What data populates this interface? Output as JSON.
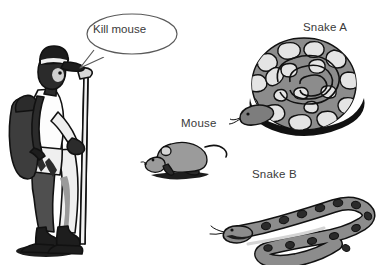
{
  "image": {
    "kind": "illustration",
    "background_color": "#ffffff",
    "width": 386,
    "height": 265
  },
  "speech": {
    "text": "Kill mouse",
    "speaker": "hiker",
    "bubble_shape": "ellipse-with-tail",
    "tail_direction": "down-left",
    "stroke_color": "#4a4a4a",
    "fill_color": "#ffffff"
  },
  "labels": {
    "snake_a": "Snake A",
    "snake_b": "Snake B",
    "mouse": "Mouse",
    "text_color": "#3a3a3a"
  },
  "figures": [
    {
      "name": "hiker",
      "description": "Man standing in profile facing right, wearing a cap, backpack, shorts and boots, holding a trekking pole",
      "palette": {
        "dark": "#1d1d1d",
        "mid": "#5f5f5f",
        "light": "#d8d8d8",
        "white": "#fdfdfd",
        "outline": "#111111"
      }
    },
    {
      "name": "mouse",
      "description": "Grey rat facing left with long tail and dark shadow beneath",
      "palette": {
        "body": "#9b9b9b",
        "shadow": "#2a2a2a",
        "outline": "#111111"
      }
    },
    {
      "name": "snake-a",
      "description": "Coiled python seen from above with mottled light blotch pattern on grey ground, head resting in the centre of the coil",
      "palette": {
        "ground": "#8c8c8c",
        "blotch": "#e2e2e2",
        "shadow": "#121212",
        "outline": "#111111"
      }
    },
    {
      "name": "snake-b",
      "description": "Grey snake lying in an S-curve, head at left with forked tongue, dark oval saddle spots along the back",
      "palette": {
        "body": "#8c8c8c",
        "spots": "#2b2b2b",
        "belly": "#d9d9d9",
        "outline": "#111111"
      }
    }
  ],
  "colors": {
    "ink": "#111111",
    "dark_grey": "#2b2b2b",
    "mid_grey": "#8c8c8c",
    "light_grey": "#d8d8d8",
    "paper": "#ffffff"
  }
}
